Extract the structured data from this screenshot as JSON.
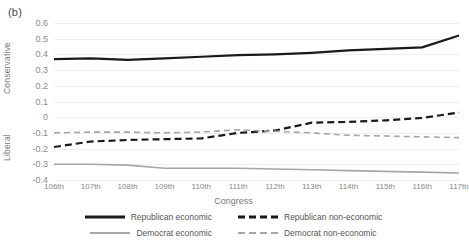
{
  "panel": {
    "label": "(b)"
  },
  "axes": {
    "y_title_top": "Conservative",
    "y_title_bottom": "Liberal",
    "x_title": "Congress",
    "y_ticks": [
      "0.6",
      "0.5",
      "0.4",
      "0.3",
      "0.2",
      "0.1",
      "0",
      "-0.1",
      "-0.2",
      "-0.3",
      "-0.4"
    ]
  },
  "legend": {
    "items": [
      {
        "label": "Republican economic",
        "color": "#1a1a1a",
        "style": "solid"
      },
      {
        "label": "Republican non-economic",
        "color": "#1a1a1a",
        "style": "dashed"
      },
      {
        "label": "Democrat economic",
        "color": "#a6a6a6",
        "style": "solid"
      },
      {
        "label": "Democrat non-economic",
        "color": "#a6a6a6",
        "style": "dashed"
      }
    ]
  },
  "chart_data": {
    "type": "line",
    "title": "",
    "xlabel": "Congress",
    "ylabel": "Conservative / Liberal",
    "ylim": [
      -0.4,
      0.6
    ],
    "ytick_step": 0.1,
    "grid": true,
    "legend_position": "bottom",
    "categories": [
      "106th",
      "107th",
      "108th",
      "109th",
      "110th",
      "111th",
      "112th",
      "113th",
      "114th",
      "115th",
      "116th",
      "117th"
    ],
    "series": [
      {
        "name": "Republican economic",
        "color": "#1a1a1a",
        "style": "solid",
        "values": [
          0.37,
          0.375,
          0.365,
          0.375,
          0.385,
          0.395,
          0.4,
          0.41,
          0.425,
          0.435,
          0.445,
          0.52
        ]
      },
      {
        "name": "Republican non-economic",
        "color": "#1a1a1a",
        "style": "dashed",
        "values": [
          -0.19,
          -0.155,
          -0.145,
          -0.14,
          -0.135,
          -0.1,
          -0.085,
          -0.035,
          -0.03,
          -0.02,
          -0.005,
          0.03
        ]
      },
      {
        "name": "Democrat economic",
        "color": "#a6a6a6",
        "style": "solid",
        "values": [
          -0.3,
          -0.3,
          -0.305,
          -0.325,
          -0.325,
          -0.325,
          -0.33,
          -0.335,
          -0.34,
          -0.345,
          -0.35,
          -0.355
        ]
      },
      {
        "name": "Democrat non-economic",
        "color": "#a6a6a6",
        "style": "dashed",
        "values": [
          -0.1,
          -0.095,
          -0.095,
          -0.1,
          -0.095,
          -0.08,
          -0.09,
          -0.1,
          -0.115,
          -0.12,
          -0.125,
          -0.13
        ]
      }
    ]
  }
}
